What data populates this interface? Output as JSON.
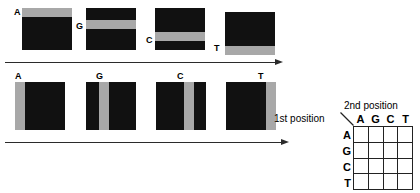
{
  "figure": {
    "colors": {
      "block_fill": "#111111",
      "band_fill": "#a8a8a8",
      "line": "#2b2b2b",
      "text": "#000000",
      "background": "#ffffff"
    }
  },
  "row1": {
    "orientation": "horizontal-band",
    "blocks": [
      {
        "label": "A",
        "band_position": "top",
        "band_offset_pct": 0,
        "band_height_pct": 21
      },
      {
        "label": "G",
        "band_position": "upper-middle",
        "band_offset_pct": 29,
        "band_height_pct": 21
      },
      {
        "label": "C",
        "band_position": "lower-middle",
        "band_offset_pct": 57,
        "band_height_pct": 21
      },
      {
        "label": "T",
        "band_position": "bottom",
        "band_offset_pct": 79,
        "band_height_pct": 21
      }
    ]
  },
  "row2": {
    "orientation": "vertical-band",
    "blocks": [
      {
        "label": "A",
        "band_position": "left",
        "band_offset_pct": 0,
        "band_width_pct": 20
      },
      {
        "label": "G",
        "band_position": "left-middle",
        "band_offset_pct": 26,
        "band_width_pct": 20
      },
      {
        "label": "C",
        "band_position": "right-middle",
        "band_offset_pct": 56,
        "band_width_pct": 20
      },
      {
        "label": "T",
        "band_position": "right",
        "band_offset_pct": 80,
        "band_width_pct": 20
      }
    ]
  },
  "arrows": [
    {
      "name": "row1-axis-arrow",
      "direction": "right"
    },
    {
      "name": "row2-axis-arrow",
      "direction": "right"
    }
  ],
  "table": {
    "row_axis_label": "1st position",
    "col_axis_label": "2nd position",
    "column_headers": [
      "A",
      "G",
      "C",
      "T"
    ],
    "row_headers": [
      "A",
      "G",
      "C",
      "T"
    ],
    "cells": [
      [
        "",
        "",
        "",
        ""
      ],
      [
        "",
        "",
        "",
        ""
      ],
      [
        "",
        "",
        "",
        ""
      ],
      [
        "",
        "",
        "",
        ""
      ]
    ]
  }
}
